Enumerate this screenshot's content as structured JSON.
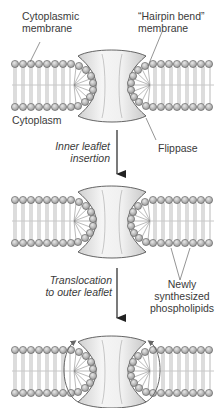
{
  "figure": {
    "panels": [
      {
        "id": "initial",
        "state": "hairpin bend at flippase"
      },
      {
        "id": "inner-inserted",
        "state": "new phospholipids inserted in inner leaflet"
      },
      {
        "id": "translocated",
        "state": "phospholipids translocated to outer leaflet",
        "arrows": "curved arrows over protein rims"
      }
    ],
    "labels": {
      "cytoplasmic_membrane_1": "Cytoplasmic",
      "cytoplasmic_membrane_2": "membrane",
      "hairpin_1": "“Hairpin bend”",
      "hairpin_2": "membrane",
      "cytoplasm": "Cytoplasm",
      "flippase": "Flippase",
      "step1_1": "Inner leaflet",
      "step1_2": "insertion",
      "step2_1": "Translocation",
      "step2_2": "to outer leaflet",
      "newly_1": "Newly",
      "newly_2": "synthesized",
      "newly_3": "phospholipids"
    },
    "colors": {
      "head_fill": "#b5b5b5",
      "head_stroke": "#5a5a5a",
      "tail": "#8a8a8a",
      "protein_fill": "#e6e6e6",
      "protein_stroke": "#555555",
      "arrow": "#222222",
      "text": "#3a3a3a"
    }
  }
}
